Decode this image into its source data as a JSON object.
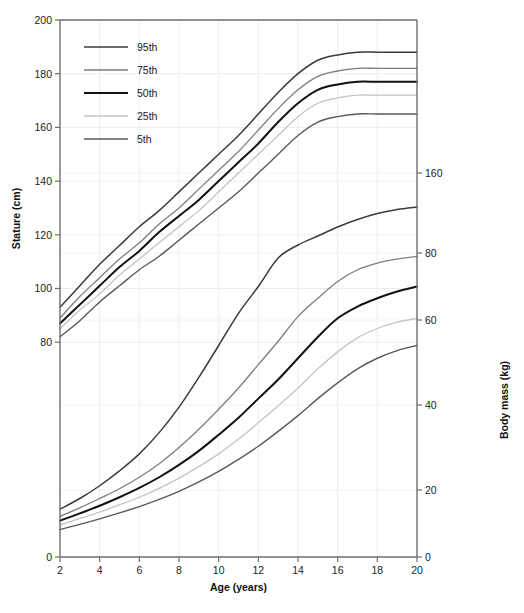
{
  "figure": {
    "background": "#ffffff",
    "plot_area": {
      "x": 60,
      "y": 20,
      "width": 357,
      "height": 537
    }
  },
  "chart_data": {
    "type": "line",
    "title": "",
    "subtitle": "",
    "xlabel": "Age (years)",
    "ylabel": "Stature (cm)",
    "y2label": "Body mass (kg)",
    "xlim": [
      2,
      20
    ],
    "ylim": [
      0,
      200
    ],
    "y2lim": [
      0,
      160
    ],
    "xticks": [
      2,
      4,
      6,
      8,
      10,
      12,
      14,
      16,
      18,
      20
    ],
    "yticks": [
      0,
      80,
      100,
      120,
      140,
      160,
      180,
      200
    ],
    "y2ticks": [
      20,
      40,
      60,
      80,
      160
    ],
    "y2tick_pixel_y": [
      490,
      405,
      320,
      253,
      173
    ],
    "grid": true,
    "legend_position": "top-left",
    "legend_title": "",
    "x": [
      2,
      3,
      4,
      5,
      6,
      7,
      8,
      9,
      10,
      11,
      12,
      13,
      14,
      15,
      16,
      17,
      18,
      19,
      20
    ],
    "series": [
      {
        "name": "95th",
        "axis": "stature",
        "color": "#3b3b3b",
        "width": 1.5,
        "values": [
          93,
          101,
          109,
          116,
          123,
          129,
          136,
          143,
          150,
          157,
          165,
          173,
          180,
          185,
          187,
          188,
          188,
          188,
          188
        ]
      },
      {
        "name": "75th",
        "axis": "stature",
        "color": "#7d7d7d",
        "width": 1.3,
        "values": [
          89,
          97,
          104,
          111,
          117,
          124,
          130,
          137,
          144,
          151,
          159,
          167,
          174,
          179,
          181,
          182,
          182,
          182,
          182
        ]
      },
      {
        "name": "50th",
        "axis": "stature",
        "color": "#111111",
        "width": 2.0,
        "values": [
          87,
          94,
          101,
          108,
          114,
          121,
          127,
          133,
          140,
          147,
          154,
          162,
          169,
          174,
          176,
          177,
          177,
          177,
          177
        ]
      },
      {
        "name": "25th",
        "axis": "stature",
        "color": "#c4c4c4",
        "width": 1.3,
        "values": [
          85,
          92,
          98,
          105,
          111,
          117,
          123,
          129,
          136,
          143,
          150,
          157,
          164,
          169,
          171,
          172,
          172,
          172,
          172
        ]
      },
      {
        "name": "5th",
        "axis": "stature",
        "color": "#595959",
        "width": 1.4,
        "values": [
          82,
          88,
          95,
          101,
          107,
          112,
          118,
          124,
          130,
          136,
          143,
          150,
          157,
          162,
          164,
          165,
          165,
          165,
          165
        ]
      },
      {
        "name": "95th",
        "axis": "mass",
        "color": "#3b3b3b",
        "width": 1.5,
        "values": [
          15.5,
          18.0,
          21.0,
          24.5,
          28.5,
          33.5,
          39.5,
          46.5,
          54.0,
          62.0,
          70.0,
          78.5,
          88.0,
          97.0,
          106.0,
          113.5,
          119.5,
          123.5,
          126.0
        ]
      },
      {
        "name": "75th",
        "axis": "mass",
        "color": "#7d7d7d",
        "width": 1.3,
        "values": [
          13.8,
          15.8,
          18.0,
          20.3,
          23.0,
          26.2,
          30.0,
          34.3,
          39.0,
          44.0,
          49.5,
          55.0,
          61.0,
          66.5,
          71.5,
          75.0,
          77.0,
          78.2,
          79.0
        ]
      },
      {
        "name": "50th",
        "axis": "mass",
        "color": "#111111",
        "width": 2.0,
        "values": [
          12.8,
          14.5,
          16.3,
          18.3,
          20.5,
          23.0,
          25.9,
          29.2,
          33.0,
          37.0,
          41.5,
          46.0,
          51.0,
          56.0,
          60.5,
          64.0,
          66.5,
          68.5,
          70.0
        ]
      },
      {
        "name": "25th",
        "axis": "mass",
        "color": "#c4c4c4",
        "width": 1.3,
        "values": [
          11.8,
          13.3,
          14.8,
          16.5,
          18.3,
          20.4,
          22.8,
          25.5,
          28.5,
          32.0,
          35.8,
          39.8,
          44.0,
          48.5,
          52.5,
          55.8,
          58.0,
          59.5,
          60.5
        ]
      },
      {
        "name": "5th",
        "axis": "mass",
        "color": "#595959",
        "width": 1.4,
        "values": [
          10.7,
          11.9,
          13.2,
          14.6,
          16.1,
          17.8,
          19.7,
          21.9,
          24.4,
          27.2,
          30.3,
          33.8,
          37.5,
          41.5,
          45.2,
          48.5,
          51.0,
          52.8,
          54.0
        ]
      }
    ],
    "legend_entries": [
      {
        "label": "95th",
        "color": "#3b3b3b",
        "width": 1.5
      },
      {
        "label": "75th",
        "color": "#7d7d7d",
        "width": 1.3
      },
      {
        "label": "50th",
        "color": "#111111",
        "width": 2.0
      },
      {
        "label": "25th",
        "color": "#c4c4c4",
        "width": 1.3
      },
      {
        "label": "5th",
        "color": "#595959",
        "width": 1.4
      }
    ]
  },
  "axes": {
    "left": {
      "label": "Stature (cm)",
      "ticks": [
        "0",
        "80",
        "100",
        "120",
        "140",
        "160",
        "180",
        "200"
      ]
    },
    "right": {
      "label": "Body mass (kg)",
      "ticks": [
        "0",
        "20",
        "40",
        "60",
        "80",
        "160"
      ]
    },
    "bottom": {
      "label": "Age (years)",
      "ticks": [
        "2",
        "4",
        "6",
        "8",
        "10",
        "12",
        "14",
        "16",
        "18",
        "20"
      ]
    }
  },
  "caption": {
    "text": ""
  }
}
